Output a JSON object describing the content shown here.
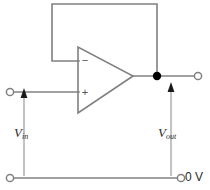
{
  "diagram": {
    "type": "schematic",
    "background_color": "#ffffff",
    "wire_color": "#808080",
    "label_color": "#2b2b2b",
    "junction_color": "#000000"
  },
  "opamp": {
    "name": "operational-amplifier",
    "inverting_input_sign": "−",
    "noninverting_input_sign": "+",
    "shape": "triangle"
  },
  "labels": {
    "vin_symbol": "V",
    "vin_subscript": "in",
    "vout_symbol": "V",
    "vout_subscript": "out",
    "ground": "0 V"
  },
  "nodes": [
    {
      "name": "input-terminal",
      "type": "open-circle",
      "x": 10,
      "y": 92
    },
    {
      "name": "output-terminal",
      "type": "open-circle",
      "x": 198,
      "y": 76
    },
    {
      "name": "ground-left-terminal",
      "type": "open-circle",
      "x": 10,
      "y": 178
    },
    {
      "name": "ground-right-terminal",
      "type": "open-circle",
      "x": 181,
      "y": 178
    },
    {
      "name": "output-junction",
      "type": "filled-dot",
      "x": 157,
      "y": 76
    }
  ],
  "arrows": [
    {
      "name": "vin-arrow",
      "direction": "up",
      "x": 24,
      "from_y": 176,
      "to_y": 94
    },
    {
      "name": "vout-arrow",
      "direction": "up",
      "x": 171,
      "from_y": 176,
      "to_y": 86
    }
  ]
}
